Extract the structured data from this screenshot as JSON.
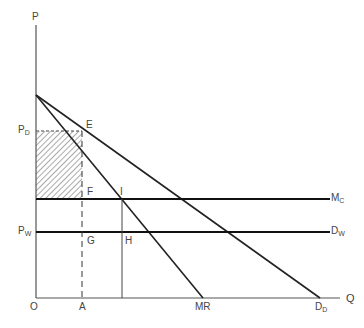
{
  "diagram": {
    "type": "economics-price-discrimination-diagram",
    "axes": {
      "y_label": "P",
      "x_label": "Q",
      "origin_label": "O"
    },
    "price_labels": {
      "pd": {
        "main": "P",
        "sub": "D"
      },
      "pw": {
        "main": "P",
        "sub": "W"
      }
    },
    "point_labels": {
      "E": "E",
      "F": "F",
      "I": "I",
      "G": "G",
      "H": "H",
      "A": "A"
    },
    "curve_labels": {
      "mc": {
        "main": "M",
        "sub": "C"
      },
      "dw": {
        "main": "D",
        "sub": "W"
      },
      "mr": "MR",
      "dd": {
        "main": "D",
        "sub": "D"
      }
    },
    "shaded_region": "rectangle between P_D and M_C from O-axis to A",
    "colors": {
      "line": "#222222",
      "axis": "#555555",
      "text": "#444444",
      "hatch": "#555555"
    }
  }
}
